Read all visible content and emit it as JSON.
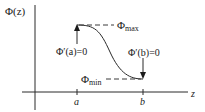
{
  "diagram": {
    "y_axis_label": "Φ(z)",
    "x_axis_label": "z",
    "tick_a": "a",
    "tick_b": "b",
    "phi_max_label": "Φ",
    "phi_max_sub": "max",
    "phi_min_label": "Φ",
    "phi_min_sub": "min",
    "deriv_a_label": "Φ′(a)=0",
    "deriv_b_label": "Φ′(b)=0",
    "colors": {
      "stroke": "#2a2a2a",
      "dash": "#3a3a3a",
      "background": "#ffffff"
    }
  }
}
